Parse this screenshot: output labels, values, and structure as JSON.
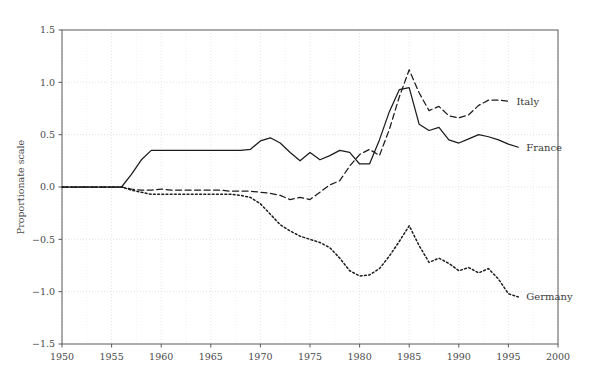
{
  "chart_data": {
    "type": "line",
    "title": "",
    "xlabel": "",
    "ylabel": "Proportionate scale",
    "xlim": [
      1950,
      2000
    ],
    "ylim": [
      -1.5,
      1.5
    ],
    "xticks": [
      1950,
      1955,
      1960,
      1965,
      1970,
      1975,
      1980,
      1985,
      1990,
      1995,
      2000
    ],
    "yticks": [
      -1.5,
      -1.0,
      -0.5,
      0.0,
      0.5,
      1.0,
      1.5
    ],
    "xtick_labels": [
      "1950",
      "1955",
      "1960",
      "1965",
      "1970",
      "1975",
      "1980",
      "1985",
      "1990",
      "1995",
      "2000"
    ],
    "ytick_labels": [
      "-1.5",
      "-1.0",
      "-0.5",
      "0.0",
      "0.5",
      "1.0",
      "1.5"
    ],
    "grid": true,
    "legend_position": "inline-right-end-of-line",
    "series": [
      {
        "name": "France",
        "style": "solid",
        "color": "#1c1c1c",
        "label": "France",
        "x": [
          1950,
          1951,
          1952,
          1953,
          1954,
          1955,
          1956,
          1957,
          1958,
          1959,
          1960,
          1961,
          1962,
          1963,
          1964,
          1965,
          1966,
          1967,
          1968,
          1969,
          1970,
          1971,
          1972,
          1973,
          1974,
          1975,
          1976,
          1977,
          1978,
          1979,
          1980,
          1981,
          1982,
          1983,
          1984,
          1985,
          1986,
          1987,
          1988,
          1989,
          1990,
          1991,
          1992,
          1993,
          1994,
          1995,
          1996
        ],
        "y": [
          0.0,
          0.0,
          0.0,
          0.0,
          0.0,
          0.0,
          0.0,
          0.12,
          0.26,
          0.35,
          0.35,
          0.35,
          0.35,
          0.35,
          0.35,
          0.35,
          0.35,
          0.35,
          0.35,
          0.36,
          0.44,
          0.47,
          0.42,
          0.33,
          0.25,
          0.33,
          0.26,
          0.3,
          0.35,
          0.33,
          0.22,
          0.22,
          0.45,
          0.72,
          0.93,
          0.95,
          0.6,
          0.54,
          0.57,
          0.45,
          0.42,
          0.46,
          0.5,
          0.48,
          0.45,
          0.41,
          0.38
        ]
      },
      {
        "name": "Italy",
        "style": "dashed",
        "color": "#1c1c1c",
        "label": "Italy",
        "x": [
          1950,
          1951,
          1952,
          1953,
          1954,
          1955,
          1956,
          1957,
          1958,
          1959,
          1960,
          1961,
          1962,
          1963,
          1964,
          1965,
          1966,
          1967,
          1968,
          1969,
          1970,
          1971,
          1972,
          1973,
          1974,
          1975,
          1976,
          1977,
          1978,
          1979,
          1980,
          1981,
          1982,
          1983,
          1984,
          1985,
          1986,
          1987,
          1988,
          1989,
          1990,
          1991,
          1992,
          1993,
          1994,
          1995
        ],
        "y": [
          0.0,
          0.0,
          0.0,
          0.0,
          0.0,
          0.0,
          0.0,
          -0.02,
          -0.03,
          -0.03,
          -0.02,
          -0.03,
          -0.03,
          -0.03,
          -0.03,
          -0.03,
          -0.03,
          -0.04,
          -0.04,
          -0.04,
          -0.05,
          -0.06,
          -0.08,
          -0.12,
          -0.1,
          -0.12,
          -0.05,
          0.02,
          0.06,
          0.2,
          0.31,
          0.36,
          0.3,
          0.55,
          0.86,
          1.12,
          0.9,
          0.73,
          0.77,
          0.68,
          0.66,
          0.69,
          0.78,
          0.83,
          0.83,
          0.82
        ]
      },
      {
        "name": "Germany",
        "style": "dotted",
        "color": "#1c1c1c",
        "label": "Germany",
        "x": [
          1950,
          1951,
          1952,
          1953,
          1954,
          1955,
          1956,
          1957,
          1958,
          1959,
          1960,
          1961,
          1962,
          1963,
          1964,
          1965,
          1966,
          1967,
          1968,
          1969,
          1970,
          1971,
          1972,
          1973,
          1974,
          1975,
          1976,
          1977,
          1978,
          1979,
          1980,
          1981,
          1982,
          1983,
          1984,
          1985,
          1986,
          1987,
          1988,
          1989,
          1990,
          1991,
          1992,
          1993,
          1994,
          1995,
          1996
        ],
        "y": [
          0.0,
          0.0,
          0.0,
          0.0,
          0.0,
          0.0,
          0.0,
          -0.03,
          -0.05,
          -0.07,
          -0.07,
          -0.07,
          -0.07,
          -0.07,
          -0.07,
          -0.07,
          -0.07,
          -0.07,
          -0.08,
          -0.1,
          -0.16,
          -0.26,
          -0.36,
          -0.42,
          -0.47,
          -0.5,
          -0.53,
          -0.58,
          -0.68,
          -0.8,
          -0.85,
          -0.84,
          -0.78,
          -0.66,
          -0.52,
          -0.37,
          -0.56,
          -0.72,
          -0.68,
          -0.73,
          -0.8,
          -0.77,
          -0.82,
          -0.78,
          -0.88,
          -1.02,
          -1.05
        ]
      }
    ]
  }
}
